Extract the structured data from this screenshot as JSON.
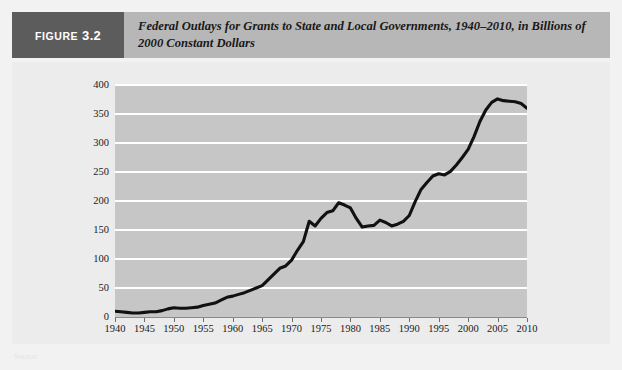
{
  "figure": {
    "badge_prefix": "FIGURE",
    "badge_number": "3.2",
    "title": "Federal Outlays for Grants to State and Local Governments, 1940–2010, in Billions of 2000 Constant Dollars",
    "source_note": "Source:"
  },
  "colors": {
    "badge_background": "#5c5c5c",
    "header_background": "#b7b7b7",
    "panel_background": "#ececec",
    "plot_background": "#c6c6c6",
    "gridline": "#ffffff",
    "line": "#111111",
    "text": "#1a1a1a"
  },
  "chart_data": {
    "type": "line",
    "title": "Federal Outlays for Grants to State and Local Governments, 1940–2010, in Billions of 2000 Constant Dollars",
    "xlabel": "",
    "ylabel": "",
    "xlim": [
      1940,
      2010
    ],
    "ylim": [
      0,
      400
    ],
    "yticks": [
      0,
      50,
      100,
      150,
      200,
      250,
      300,
      350,
      400
    ],
    "ytick_labels": [
      "0",
      "50",
      "100",
      "150",
      "200",
      "250",
      "300",
      "350",
      "400"
    ],
    "xticks": [
      1940,
      1945,
      1950,
      1955,
      1960,
      1965,
      1970,
      1975,
      1980,
      1985,
      1990,
      1995,
      2000,
      2005,
      2010
    ],
    "xtick_labels": [
      "1940",
      "1945",
      "1950",
      "1955",
      "1960",
      "1965",
      "1970",
      "1975",
      "1980",
      "1985",
      "1990",
      "1995",
      "2000",
      "2005",
      "2010"
    ],
    "grid": "horizontal",
    "legend": "none",
    "series": [
      {
        "name": "Federal grant outlays (billions of 2000 constant dollars)",
        "x": [
          1940,
          1941,
          1942,
          1943,
          1944,
          1945,
          1946,
          1947,
          1948,
          1949,
          1950,
          1951,
          1952,
          1953,
          1954,
          1955,
          1956,
          1957,
          1958,
          1959,
          1960,
          1961,
          1962,
          1963,
          1964,
          1965,
          1966,
          1967,
          1968,
          1969,
          1970,
          1971,
          1972,
          1973,
          1974,
          1975,
          1976,
          1977,
          1978,
          1979,
          1980,
          1981,
          1982,
          1983,
          1984,
          1985,
          1986,
          1987,
          1988,
          1989,
          1990,
          1991,
          1992,
          1993,
          1994,
          1995,
          1996,
          1997,
          1998,
          1999,
          2000,
          2001,
          2002,
          2003,
          2004,
          2005,
          2006,
          2007,
          2008,
          2009,
          2010
        ],
        "y": [
          10,
          9,
          8,
          7,
          7,
          8,
          9,
          9,
          11,
          14,
          16,
          15,
          15,
          16,
          17,
          20,
          22,
          24,
          29,
          34,
          36,
          39,
          42,
          46,
          50,
          54,
          64,
          74,
          84,
          88,
          98,
          115,
          130,
          165,
          157,
          170,
          180,
          183,
          197,
          193,
          188,
          170,
          155,
          157,
          158,
          167,
          163,
          157,
          160,
          165,
          175,
          199,
          220,
          232,
          243,
          247,
          245,
          251,
          262,
          275,
          289,
          311,
          337,
          357,
          370,
          376,
          373,
          372,
          371,
          368,
          360
        ]
      }
    ]
  }
}
